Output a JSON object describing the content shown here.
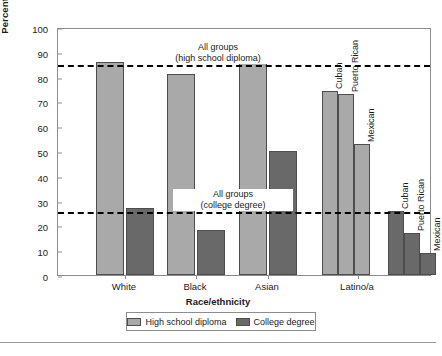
{
  "chart_data": {
    "type": "bar",
    "title": "",
    "xlabel": "Race/ethnicity",
    "ylabel": "Percentage who complete education",
    "ylim": [
      0,
      100
    ],
    "ytick_step": 10,
    "yticks": [
      "0",
      "10",
      "20",
      "30",
      "40",
      "50",
      "60",
      "70",
      "80",
      "90",
      "100"
    ],
    "grid": false,
    "legend_position": "bottom",
    "categories": [
      "White",
      "Black",
      "Asian",
      "Latino/a"
    ],
    "series": [
      {
        "name": "High school diploma",
        "color": "#a9a9a9",
        "values": [
          86,
          81,
          88,
          null
        ]
      },
      {
        "name": "College degree",
        "color": "#696969",
        "values": [
          27,
          18,
          50,
          null
        ]
      }
    ],
    "subgroups": {
      "parent": "Latino/a",
      "names": [
        "Cuban",
        "Puerto Rican",
        "Mexican"
      ],
      "high_school_diploma": [
        74,
        73,
        53
      ],
      "college_degree": [
        26,
        17,
        9
      ]
    },
    "reference_lines": [
      {
        "value": 85,
        "label_line1": "All groups",
        "label_line2": "(high school diploma)",
        "style": "dashed"
      },
      {
        "value": 26,
        "label_line1": "All groups",
        "label_line2": "(college degree)",
        "style": "dashed"
      }
    ],
    "annotations": [
      "All groups (high school diploma)",
      "All groups (college degree)",
      "Cuban",
      "Puerto Rican",
      "Mexican"
    ]
  },
  "legend": {
    "entries": [
      {
        "label": "High school diploma",
        "swatch": "hs"
      },
      {
        "label": "College degree",
        "swatch": "cd"
      }
    ]
  },
  "ghost_text": {
    "top": "",
    "bottom": ""
  }
}
